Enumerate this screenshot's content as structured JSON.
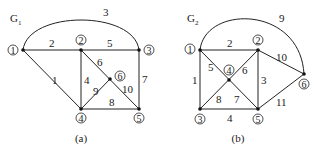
{
  "graphs": [
    {
      "id": "G1",
      "title": "G",
      "subscript": "1",
      "caption": "(a)",
      "nodes": [
        {
          "id": "1",
          "label": "1",
          "x": 23,
          "y": 50
        },
        {
          "id": "2",
          "label": "2",
          "x": 81,
          "y": 50
        },
        {
          "id": "3",
          "label": "3",
          "x": 139,
          "y": 50
        },
        {
          "id": "4",
          "label": "4",
          "x": 81,
          "y": 109
        },
        {
          "id": "5",
          "label": "5",
          "x": 139,
          "y": 109
        },
        {
          "id": "6",
          "label": "6",
          "x": 110,
          "y": 79
        }
      ],
      "edges": [
        {
          "from": "1",
          "to": "2",
          "weight": "2"
        },
        {
          "from": "1",
          "to": "3",
          "weight": "3",
          "curved": true
        },
        {
          "from": "1",
          "to": "4",
          "weight": "1"
        },
        {
          "from": "2",
          "to": "3",
          "weight": "5"
        },
        {
          "from": "2",
          "to": "4",
          "weight": "4"
        },
        {
          "from": "2",
          "to": "6",
          "weight": "6"
        },
        {
          "from": "6",
          "to": "4",
          "weight": "9"
        },
        {
          "from": "6",
          "to": "5",
          "weight": "10"
        },
        {
          "from": "3",
          "to": "5",
          "weight": "7"
        },
        {
          "from": "4",
          "to": "5",
          "weight": "8"
        }
      ]
    },
    {
      "id": "G2",
      "title": "G",
      "subscript": "2",
      "caption": "(b)",
      "nodes": [
        {
          "id": "1",
          "label": "1",
          "x": 200,
          "y": 50
        },
        {
          "id": "2",
          "label": "2",
          "x": 258,
          "y": 50
        },
        {
          "id": "3",
          "label": "3",
          "x": 200,
          "y": 109
        },
        {
          "id": "4",
          "label": "4",
          "x": 229,
          "y": 80
        },
        {
          "id": "5",
          "label": "5",
          "x": 258,
          "y": 109
        },
        {
          "id": "6",
          "label": "6",
          "x": 304,
          "y": 74
        }
      ],
      "edges": [
        {
          "from": "1",
          "to": "2",
          "weight": "2"
        },
        {
          "from": "1",
          "to": "3",
          "weight": "1"
        },
        {
          "from": "1",
          "to": "4",
          "weight": "5"
        },
        {
          "from": "1",
          "to": "6",
          "weight": "9",
          "curved": true
        },
        {
          "from": "2",
          "to": "4",
          "weight": "6"
        },
        {
          "from": "2",
          "to": "5",
          "weight": "3"
        },
        {
          "from": "2",
          "to": "6",
          "weight": "10"
        },
        {
          "from": "3",
          "to": "4",
          "weight": "8"
        },
        {
          "from": "3",
          "to": "5",
          "weight": "4"
        },
        {
          "from": "4",
          "to": "5",
          "weight": "7"
        },
        {
          "from": "5",
          "to": "6",
          "weight": "11"
        }
      ]
    }
  ],
  "labels": {
    "g1": {
      "w12": "2",
      "w13": "3",
      "w14": "1",
      "w23": "5",
      "w24": "4",
      "w26": "6",
      "w64": "9",
      "w65": "10",
      "w35": "7",
      "w45": "8",
      "n1": "1",
      "n2": "2",
      "n3": "3",
      "n4": "4",
      "n5": "5",
      "n6": "6",
      "title": "G",
      "sub": "1",
      "caption": "(a)"
    },
    "g2": {
      "w12": "2",
      "w13": "1",
      "w14": "5",
      "w16": "9",
      "w24": "6",
      "w25": "3",
      "w26": "10",
      "w34": "8",
      "w35": "4",
      "w45": "7",
      "w56": "11",
      "n1": "1",
      "n2": "2",
      "n3": "3",
      "n4": "4",
      "n5": "5",
      "n6": "6",
      "title": "G",
      "sub": "2",
      "caption": "(b)"
    }
  }
}
